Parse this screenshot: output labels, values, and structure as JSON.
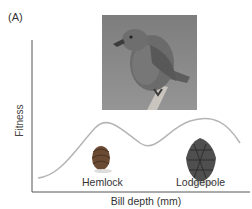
{
  "panel_label": "(A)",
  "axes": {
    "ylabel": "Fitness",
    "xlabel": "Bill depth (mm)"
  },
  "photo": {
    "subject": "crossbill bird perched on branch"
  },
  "curve": {
    "description": "bimodal fitness landscape with two peaks",
    "peaks": [
      {
        "label": "Hemlock",
        "relative_height": "lower"
      },
      {
        "label": "Lodgepole",
        "relative_height": "higher"
      }
    ],
    "color": "#b5b5b5"
  },
  "labels": {
    "hemlock": "Hemlock",
    "lodgepole": "Lodgepole"
  },
  "icons": [
    "hemlock-cone-icon",
    "lodgepole-cone-icon"
  ]
}
